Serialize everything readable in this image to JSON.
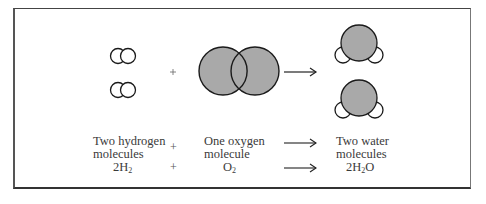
{
  "diagram": {
    "colors": {
      "atom_fill": "#a9a9a9",
      "outline": "#1a1a1a",
      "hydrogen_fill": "#ffffff"
    },
    "reactants": [
      {
        "label_line1": "Two hydrogen",
        "label_line2": "molecules",
        "formula_coef": "2H",
        "formula_sub": "2"
      },
      {
        "label_line1": "One oxygen",
        "label_line2": "molecule",
        "formula_coef": "O",
        "formula_sub": "2"
      }
    ],
    "product": {
      "label_line1": "Two water",
      "label_line2": "molecules",
      "formula_pre": "2H",
      "formula_sub": "2",
      "formula_post": "O"
    },
    "operators": {
      "plus": "+",
      "arrow": "→"
    }
  }
}
